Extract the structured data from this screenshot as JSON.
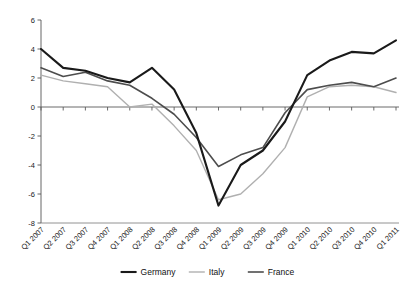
{
  "chart_data": {
    "type": "line",
    "title": "",
    "xlabel": "",
    "ylabel": "",
    "ylim": [
      -8,
      6
    ],
    "yticks": [
      6,
      4,
      2,
      0,
      -2,
      -4,
      -6,
      -8
    ],
    "grid": false,
    "legend_position": "bottom",
    "zero_line": true,
    "categories": [
      "Q1 2007",
      "Q2 2007",
      "Q3 2007",
      "Q4 2007",
      "Q1 2008",
      "Q2 2008",
      "Q3 2008",
      "Q4 2008",
      "Q1 2009",
      "Q2 2009",
      "Q3 2009",
      "Q4 2009",
      "Q1 2010",
      "Q2 2010",
      "Q3 2010",
      "Q4 2010",
      "Q1 2011"
    ],
    "series": [
      {
        "name": "Germany",
        "color": "#1a1a1a",
        "width": 2.1,
        "values": [
          4.0,
          2.7,
          2.5,
          2.0,
          1.7,
          2.7,
          1.2,
          -1.8,
          -6.8,
          -4.0,
          -3.0,
          -1.0,
          2.2,
          3.2,
          3.8,
          3.7,
          4.6
        ]
      },
      {
        "name": "Italy",
        "color": "#b0b0b0",
        "width": 1.4,
        "values": [
          2.2,
          1.8,
          1.6,
          1.4,
          0.0,
          0.2,
          -1.3,
          -3.0,
          -6.4,
          -6.0,
          -4.6,
          -2.8,
          0.7,
          1.4,
          1.5,
          1.4,
          1.0
        ]
      },
      {
        "name": "France",
        "color": "#4d4d4d",
        "width": 1.6,
        "values": [
          2.7,
          2.1,
          2.4,
          1.8,
          1.5,
          0.6,
          -0.5,
          -2.1,
          -4.1,
          -3.3,
          -2.8,
          -0.4,
          1.2,
          1.5,
          1.7,
          1.4,
          2.0
        ]
      }
    ]
  },
  "legend": {
    "items": [
      {
        "label": "Germany"
      },
      {
        "label": "Italy"
      },
      {
        "label": "France"
      }
    ]
  }
}
